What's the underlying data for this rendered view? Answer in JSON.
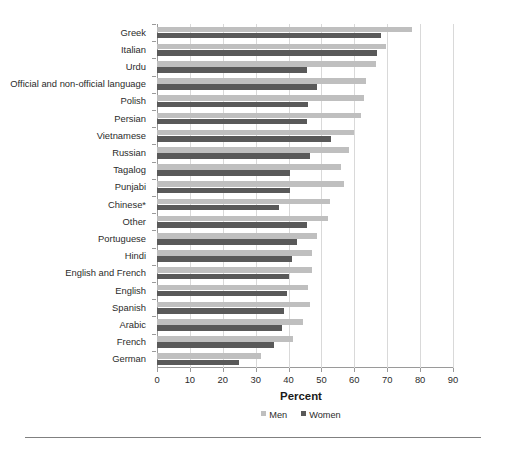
{
  "chart_data": {
    "type": "bar",
    "orientation": "horizontal",
    "title": "",
    "xlabel": "Percent",
    "ylabel": "",
    "xlim": [
      0,
      90
    ],
    "xticks": [
      0,
      10,
      20,
      30,
      40,
      50,
      60,
      70,
      80,
      90
    ],
    "grid": "vertical",
    "legend_position": "bottom-center",
    "categories": [
      "Greek",
      "Italian",
      "Urdu",
      "Official and non-official language",
      "Polish",
      "Persian",
      "Vietnamese",
      "Russian",
      "Tagalog",
      "Punjabi",
      "Chinese*",
      "Other",
      "Portuguese",
      "Hindi",
      "English and French",
      "English",
      "Spanish",
      "Arabic",
      "French",
      "German"
    ],
    "series": [
      {
        "name": "Men",
        "color": "#bfbfbf",
        "values": [
          77.5,
          69.5,
          66.5,
          63.5,
          63.0,
          62.0,
          60.0,
          58.5,
          56.0,
          57.0,
          52.5,
          52.0,
          48.5,
          47.0,
          47.0,
          46.0,
          46.5,
          44.5,
          41.5,
          31.5
        ]
      },
      {
        "name": "Women",
        "color": "#595959",
        "values": [
          68.0,
          67.0,
          45.5,
          48.5,
          46.0,
          45.5,
          53.0,
          46.5,
          40.5,
          40.5,
          37.0,
          45.5,
          42.5,
          41.0,
          40.0,
          39.5,
          38.5,
          38.0,
          35.5,
          25.0
        ]
      }
    ],
    "legend": [
      "Men",
      "Women"
    ],
    "footnote": ""
  },
  "axis": {
    "x_title": "Percent"
  },
  "colors": {
    "men": "#bfbfbf",
    "women": "#595959",
    "gridline": "#d9d9d9",
    "axis": "#9a9a9a",
    "text": "#2b2b2b"
  }
}
